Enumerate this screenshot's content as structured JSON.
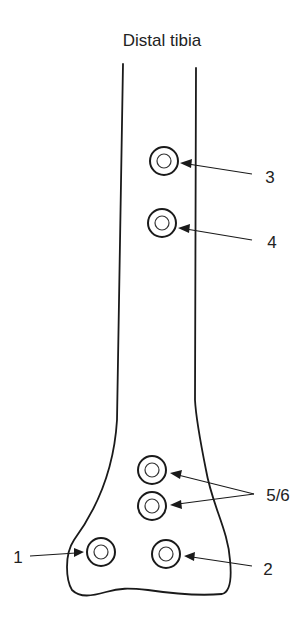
{
  "title": "Distal tibia",
  "pins": [
    {
      "id": "3",
      "label": "3"
    },
    {
      "id": "4",
      "label": "4"
    },
    {
      "id": "5",
      "label": "5/6"
    },
    {
      "id": "6",
      "label": "5/6"
    },
    {
      "id": "1",
      "label": "1"
    },
    {
      "id": "2",
      "label": "2"
    }
  ],
  "labels": {
    "pin3": "3",
    "pin4": "4",
    "pin56": "5/6",
    "pin1": "1",
    "pin2": "2"
  }
}
